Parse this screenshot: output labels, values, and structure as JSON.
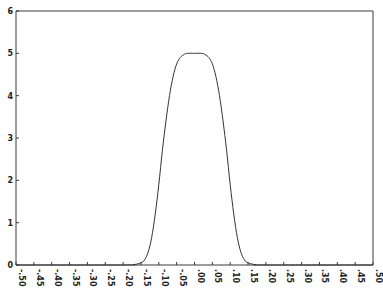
{
  "chart_data": {
    "type": "line",
    "title": "",
    "xlabel": "",
    "ylabel": "",
    "xlim": [
      -0.5,
      0.5
    ],
    "ylim": [
      0,
      6
    ],
    "grid": false,
    "x_ticks": [
      -0.5,
      -0.45,
      -0.4,
      -0.35,
      -0.3,
      -0.25,
      -0.2,
      -0.15,
      -0.1,
      -0.05,
      0.0,
      0.05,
      0.1,
      0.15,
      0.2,
      0.25,
      0.3,
      0.35,
      0.4,
      0.45,
      0.5
    ],
    "x_tick_labels": [
      "-.50",
      "-.45",
      "-.40",
      "-.35",
      "-.30",
      "-.25",
      "-.20",
      "-.15",
      "-.10",
      "-.05",
      ".00",
      ".05",
      ".10",
      ".15",
      ".20",
      ".25",
      ".30",
      ".35",
      ".40",
      ".45",
      ".50"
    ],
    "y_ticks": [
      0,
      1,
      2,
      3,
      4,
      5,
      6
    ],
    "y_tick_labels": [
      "0",
      "1",
      "2",
      "3",
      "4",
      "5",
      "6"
    ],
    "series": [
      {
        "name": "curve",
        "x": [
          -0.5,
          -0.2,
          -0.17,
          -0.15,
          -0.14,
          -0.13,
          -0.12,
          -0.11,
          -0.1,
          -0.09,
          -0.08,
          -0.07,
          -0.06,
          -0.05,
          -0.04,
          -0.03,
          -0.02,
          0.0,
          0.02,
          0.03,
          0.04,
          0.05,
          0.06,
          0.07,
          0.08,
          0.09,
          0.1,
          0.11,
          0.12,
          0.13,
          0.14,
          0.15,
          0.17,
          0.2,
          0.5
        ],
        "y": [
          0,
          0,
          0.01,
          0.05,
          0.12,
          0.3,
          0.65,
          1.2,
          1.9,
          2.7,
          3.4,
          4.0,
          4.45,
          4.75,
          4.9,
          4.97,
          5.0,
          5.0,
          5.0,
          4.97,
          4.9,
          4.75,
          4.45,
          4.0,
          3.4,
          2.7,
          1.9,
          1.2,
          0.65,
          0.3,
          0.12,
          0.05,
          0.01,
          0,
          0
        ]
      }
    ]
  }
}
